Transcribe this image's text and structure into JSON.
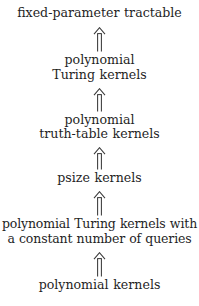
{
  "diagram": {
    "type": "implication-hierarchy",
    "title": "",
    "direction": "bottom-to-top",
    "arrow_glyph": "double-up-arrow",
    "colors": {
      "background": "#ffffff",
      "text": "#1f1f1f",
      "arrow": "#3a3a3a"
    },
    "nodes": [
      {
        "id": "fpt",
        "lines": [
          "fixed-parameter tractable"
        ]
      },
      {
        "id": "polynomial-turing-kernels",
        "lines": [
          "polynomial",
          "Turing kernels"
        ]
      },
      {
        "id": "polynomial-truth-table-kernels",
        "lines": [
          "polynomial",
          "truth-table kernels"
        ]
      },
      {
        "id": "psize-kernels",
        "lines": [
          "psize kernels"
        ]
      },
      {
        "id": "polynomial-turing-kernels-constant-queries",
        "lines": [
          "polynomial Turing kernels with",
          "a constant number of queries"
        ]
      },
      {
        "id": "polynomial-kernels",
        "lines": [
          "polynomial kernels"
        ]
      }
    ],
    "edges": [
      {
        "from": "polynomial-turing-kernels",
        "to": "fpt",
        "glyph": "double-up-arrow"
      },
      {
        "from": "polynomial-truth-table-kernels",
        "to": "polynomial-turing-kernels",
        "glyph": "double-up-arrow"
      },
      {
        "from": "psize-kernels",
        "to": "polynomial-truth-table-kernels",
        "glyph": "double-up-arrow"
      },
      {
        "from": "polynomial-turing-kernels-constant-queries",
        "to": "psize-kernels",
        "glyph": "double-up-arrow"
      },
      {
        "from": "polynomial-kernels",
        "to": "polynomial-turing-kernels-constant-queries",
        "glyph": "double-up-arrow"
      }
    ]
  }
}
